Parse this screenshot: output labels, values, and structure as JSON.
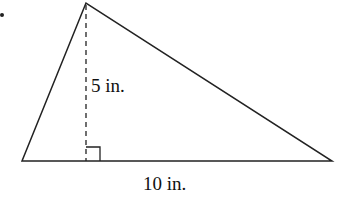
{
  "figure": {
    "type": "triangle",
    "height_label": "5 in.",
    "base_label": "10 in.",
    "vertices": {
      "apex": [
        86,
        3
      ],
      "base_left": [
        22,
        161
      ],
      "base_right": [
        332,
        161
      ]
    },
    "altitude": {
      "x": 86,
      "y_top": 5,
      "y_bottom": 161,
      "style": "dashed"
    },
    "right_angle_marker": {
      "x": 86,
      "y": 147,
      "size": 14
    },
    "bullet": [
      2,
      15
    ],
    "stroke_color": "#222222"
  }
}
